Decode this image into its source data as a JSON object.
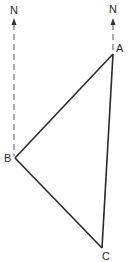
{
  "diagram": {
    "type": "bearing-triangle",
    "north_markers": [
      {
        "id": "north-left",
        "label": "N",
        "x": 14,
        "label_y": 14,
        "arrow_tip_y": 19,
        "line_bottom_y": 156
      },
      {
        "id": "north-right",
        "label": "N",
        "x": 113,
        "label_y": 13,
        "arrow_tip_y": 19,
        "line_bottom_y": 52
      }
    ],
    "vertices": [
      {
        "id": "A",
        "label": "A",
        "x": 113,
        "y": 54,
        "label_x": 117,
        "label_y": 53
      },
      {
        "id": "B",
        "label": "B",
        "x": 15,
        "y": 158,
        "label_x": 4,
        "label_y": 162
      },
      {
        "id": "C",
        "label": "C",
        "x": 102,
        "y": 248,
        "label_x": 103,
        "label_y": 260
      }
    ],
    "edges": [
      {
        "from": "A",
        "to": "B"
      },
      {
        "from": "B",
        "to": "C"
      },
      {
        "from": "C",
        "to": "A"
      }
    ],
    "colors": {
      "line": "#2a2a2a",
      "dashed": "#555555",
      "background": "#ffffff"
    }
  }
}
